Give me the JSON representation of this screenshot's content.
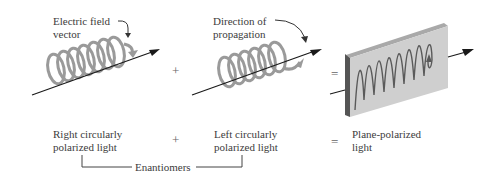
{
  "diagram": {
    "top_labels": {
      "electric_field": [
        "Electric field",
        "vector"
      ],
      "direction": [
        "Direction of",
        "propagation"
      ]
    },
    "operators": {
      "plus_top": "+",
      "equals_top": "=",
      "plus_bottom": "+",
      "equals_bottom": "="
    },
    "bottom_labels": {
      "right": [
        "Right circularly",
        "polarized light"
      ],
      "left": [
        "Left circularly",
        "polarized light"
      ],
      "plane": [
        "Plane-polarized",
        "light"
      ]
    },
    "bracket_label": "Enantiomers",
    "colors": {
      "helix": "#9a9a9a",
      "arrow": "#1a1a1a",
      "plate_face": "#cfcfcf",
      "plate_edge": "#555555",
      "plate_top": "#a9a9a9",
      "wave": "#5a5a5a"
    }
  }
}
